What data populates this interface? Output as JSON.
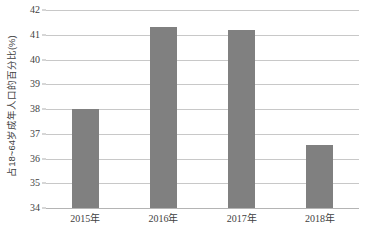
{
  "chart_data": {
    "type": "bar",
    "title": "",
    "subtitle": "",
    "xlabel": "",
    "ylabel": "占18~64岁成年人口的百分比(%)",
    "categories": [
      "2015年",
      "2016年",
      "2017年",
      "2018年"
    ],
    "values": [
      38.0,
      41.3,
      41.2,
      36.55
    ],
    "series": [
      {
        "name": "占18~64岁成年人口的百分比(%)",
        "values": [
          38.0,
          41.3,
          41.2,
          36.55
        ]
      }
    ],
    "ylim": [
      34,
      42
    ],
    "y_ticks": [
      34,
      35,
      36,
      37,
      38,
      39,
      40,
      41,
      42
    ],
    "y_tick_labels": [
      "34",
      "35",
      "36",
      "37",
      "38",
      "39",
      "40",
      "41",
      "42"
    ],
    "grid": true,
    "legend": false,
    "legend_position": "none",
    "bar_color": "#808080",
    "gridline_color": "#c8c8c8",
    "axis_color": "#b4b4b4",
    "text_color": "#3f3f3f",
    "background_color": "#ffffff",
    "annotations": []
  }
}
